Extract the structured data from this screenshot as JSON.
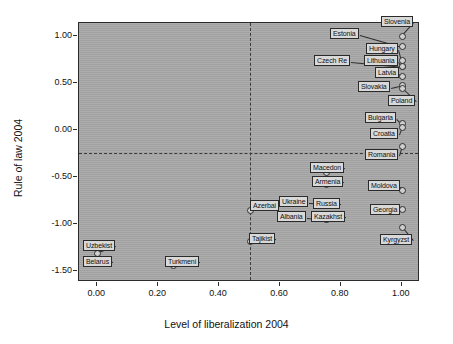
{
  "chart_data": {
    "type": "scatter",
    "title": "",
    "xlabel": "Level of liberalization 2004",
    "ylabel": "Rule of law 2004",
    "xlim": [
      -0.06,
      1.06
    ],
    "ylim": [
      -1.62,
      1.14
    ],
    "xticks": [
      "0.00",
      "0.20",
      "0.40",
      "0.60",
      "0.80",
      "1.00"
    ],
    "xtickvalues": [
      0.0,
      0.2,
      0.4,
      0.6,
      0.8,
      1.0
    ],
    "yticks": [
      "1.00",
      "0.50",
      "0.00",
      "-0.50",
      "-1.00",
      "-1.50"
    ],
    "ytickvalues": [
      1.0,
      0.5,
      0.0,
      -0.5,
      -1.0,
      -1.5
    ],
    "grid": false,
    "legend": null,
    "reference_lines": [
      {
        "orientation": "vertical",
        "value": 0.5,
        "style": "dashed"
      },
      {
        "orientation": "horizontal",
        "value": -0.25,
        "style": "dashed"
      }
    ],
    "points": [
      {
        "label": "Slovenia",
        "x": 1.0,
        "y": 1.0,
        "lx": 381,
        "ly": 16,
        "anchor": "left"
      },
      {
        "label": "Estonia",
        "x": 1.0,
        "y": 0.89,
        "lx": 330,
        "ly": 28,
        "anchor": "left"
      },
      {
        "label": "Hungary",
        "x": 1.0,
        "y": 0.75,
        "lx": 366,
        "ly": 43,
        "anchor": "left"
      },
      {
        "label": "Lithuania",
        "x": 1.0,
        "y": 0.68,
        "lx": 364,
        "ly": 55,
        "anchor": "left"
      },
      {
        "label": "Czech Re",
        "x": 1.0,
        "y": 0.68,
        "lx": 314,
        "ly": 55,
        "anchor": "left"
      },
      {
        "label": "Latvia",
        "x": 1.0,
        "y": 0.57,
        "lx": 375,
        "ly": 67,
        "anchor": "left"
      },
      {
        "label": "Slovakia",
        "x": 1.0,
        "y": 0.48,
        "lx": 358,
        "ly": 81,
        "anchor": "left"
      },
      {
        "label": "Poland",
        "x": 1.0,
        "y": 0.45,
        "lx": 388,
        "ly": 95,
        "anchor": "left"
      },
      {
        "label": "Bulgaria",
        "x": 1.0,
        "y": 0.07,
        "lx": 365,
        "ly": 112,
        "anchor": "left"
      },
      {
        "label": "Croatia",
        "x": 1.0,
        "y": 0.03,
        "lx": 370,
        "ly": 128,
        "anchor": "left"
      },
      {
        "label": "Romania",
        "x": 1.0,
        "y": -0.17,
        "lx": 365,
        "ly": 149,
        "anchor": "left"
      },
      {
        "label": "Macedon",
        "x": 0.75,
        "y": -0.45,
        "lx": 310,
        "ly": 162,
        "anchor": "left"
      },
      {
        "label": "Armenia",
        "x": 0.75,
        "y": -0.58,
        "lx": 312,
        "ly": 176,
        "anchor": "left"
      },
      {
        "label": "Moldova",
        "x": 1.0,
        "y": -0.64,
        "lx": 368,
        "ly": 180,
        "anchor": "left"
      },
      {
        "label": "Ukraine",
        "x": 0.75,
        "y": -0.78,
        "lx": 279,
        "ly": 196,
        "anchor": "left"
      },
      {
        "label": "Russia",
        "x": 0.75,
        "y": -0.8,
        "lx": 313,
        "ly": 198,
        "anchor": "left"
      },
      {
        "label": "Azerbai",
        "x": 0.5,
        "y": -0.85,
        "lx": 250,
        "ly": 200,
        "anchor": "left"
      },
      {
        "label": "Georgia",
        "x": 1.0,
        "y": -0.84,
        "lx": 370,
        "ly": 204,
        "anchor": "left"
      },
      {
        "label": "Albania",
        "x": 0.75,
        "y": -0.95,
        "lx": 277,
        "ly": 211,
        "anchor": "left"
      },
      {
        "label": "Kazakhst",
        "x": 0.75,
        "y": -0.95,
        "lx": 311,
        "ly": 211,
        "anchor": "left"
      },
      {
        "label": "Kyrgyzst",
        "x": 1.0,
        "y": -1.03,
        "lx": 380,
        "ly": 234,
        "anchor": "left"
      },
      {
        "label": "Tajikist",
        "x": 0.5,
        "y": -1.18,
        "lx": 249,
        "ly": 233,
        "anchor": "left"
      },
      {
        "label": "Uzbekist",
        "x": 0.0,
        "y": -1.31,
        "lx": 83,
        "ly": 240,
        "anchor": "left"
      },
      {
        "label": "Belarus",
        "x": 0.0,
        "y": -1.38,
        "lx": 83,
        "ly": 256,
        "anchor": "left"
      },
      {
        "label": "Turkmeni",
        "x": 0.25,
        "y": -1.44,
        "lx": 165,
        "ly": 256,
        "anchor": "left"
      }
    ]
  }
}
